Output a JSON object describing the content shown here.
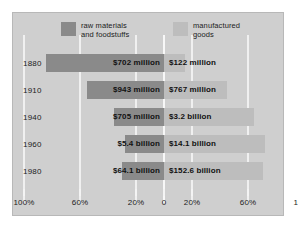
{
  "chart_data": {
    "type": "bar",
    "orientation": "horizontal-diverging",
    "title": "",
    "subtitle": "",
    "xlabel": "",
    "ylabel": "",
    "categories": [
      "1880",
      "1910",
      "1940",
      "1960",
      "1980"
    ],
    "xlim": [
      -100,
      100
    ],
    "xticks": [
      -100,
      -60,
      -20,
      0,
      20,
      60,
      100
    ],
    "xtick_labels": [
      "100%",
      "60%",
      "20%",
      "0",
      "20%",
      "60%",
      "100%"
    ],
    "grid": true,
    "legend_position": "top",
    "series": [
      {
        "name": "raw materials and foodstuffs",
        "side": "left",
        "color": "#8a8a8a",
        "values": [
          -84,
          -55,
          -36,
          -28,
          -30
        ],
        "labels": [
          "$702 million",
          "$943 million",
          "$705 million",
          "$5.4 billion",
          "$64.1 billion"
        ]
      },
      {
        "name": "manufactured goods",
        "side": "right",
        "color": "#bdbdbd",
        "values": [
          15,
          45,
          64,
          72,
          71
        ],
        "labels": [
          "$122 million",
          "$767 million",
          "$3.2 billion",
          "$14.1 billion",
          "$152.6 billion"
        ]
      }
    ]
  },
  "legend": {
    "raw": {
      "label": "raw materials\nand foodstuffs",
      "swatch_color": "#8a8a8a"
    },
    "manufactured": {
      "label": "manufactured\ngoods",
      "swatch_color": "#bdbdbd"
    }
  },
  "rows": [
    {
      "year": "1880",
      "raw_label": "$702 million",
      "man_label": "$122 million",
      "raw_pct": -84,
      "man_pct": 15
    },
    {
      "year": "1910",
      "raw_label": "$943 million",
      "man_label": "$767 million",
      "raw_pct": -55,
      "man_pct": 45
    },
    {
      "year": "1940",
      "raw_label": "$705 million",
      "man_label": "$3.2 billion",
      "raw_pct": -36,
      "man_pct": 64
    },
    {
      "year": "1960",
      "raw_label": "$5.4 billion",
      "man_label": "$14.1 billion",
      "raw_pct": -28,
      "man_pct": 72
    },
    {
      "year": "1980",
      "raw_label": "$64.1 billion",
      "man_label": "$152.6 billion",
      "raw_pct": -30,
      "man_pct": 71
    }
  ],
  "axis": {
    "ticks": [
      {
        "value": -100,
        "label": "100%"
      },
      {
        "value": -60,
        "label": "60%"
      },
      {
        "value": -20,
        "label": "20%"
      },
      {
        "value": 0,
        "label": "0"
      },
      {
        "value": 20,
        "label": "20%"
      },
      {
        "value": 60,
        "label": "60%"
      },
      {
        "value": 100,
        "label": "100%"
      }
    ]
  },
  "colors": {
    "plate_background": "#cfcfcf",
    "page_background": "#ffffff",
    "gridline": "#f2f2f2",
    "raw_bar": "#8a8a8a",
    "manufactured_bar": "#bdbdbd",
    "text": "#1c1c1c"
  }
}
